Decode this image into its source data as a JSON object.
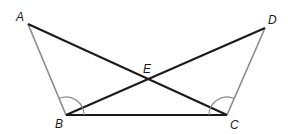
{
  "diagram": {
    "type": "geometry",
    "colors": {
      "dark_line": "#1a1a1a",
      "gray_line": "#8a8a8a",
      "arc": "#8a8a8a"
    },
    "points": {
      "A": {
        "label": "A",
        "x": 28,
        "y": 24
      },
      "B": {
        "label": "B",
        "x": 66,
        "y": 115
      },
      "C": {
        "label": "C",
        "x": 227,
        "y": 115
      },
      "D": {
        "label": "D",
        "x": 265,
        "y": 28
      },
      "E": {
        "label": "E",
        "x": 148,
        "y": 78
      }
    },
    "segments": [
      {
        "name": "AB",
        "style": "gray"
      },
      {
        "name": "DC",
        "style": "gray"
      },
      {
        "name": "AC",
        "style": "dark"
      },
      {
        "name": "BD",
        "style": "dark"
      },
      {
        "name": "BC",
        "style": "dark"
      }
    ],
    "angle_marks": [
      {
        "vertex": "B",
        "between": [
          "A",
          "C"
        ]
      },
      {
        "vertex": "C",
        "between": [
          "D",
          "B"
        ]
      }
    ]
  }
}
